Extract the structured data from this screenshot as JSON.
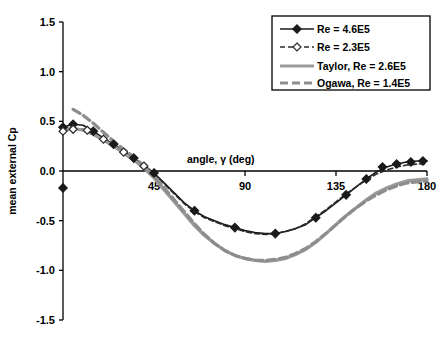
{
  "chart_data": {
    "type": "line",
    "title": "",
    "xlabel": "angle, γ (deg)",
    "ylabel": "mean external Cp",
    "xlim": [
      0,
      180
    ],
    "ylim": [
      -1.5,
      1.5
    ],
    "xticks": [
      0,
      45,
      90,
      135,
      180
    ],
    "xtick_labels": [
      "0",
      "45",
      "90",
      "135",
      "180"
    ],
    "yticks": [
      -1.5,
      -1.0,
      -0.5,
      0.0,
      0.5,
      1.0,
      1.5
    ],
    "ytick_labels": [
      "-1.5",
      "-1.0",
      "-0.5",
      "0.0",
      "0.5",
      "1.0",
      "1.5"
    ],
    "grid": false,
    "legend_position": "top-right",
    "series": [
      {
        "name": "Re = 4.6E5",
        "color": "#1a1a1a",
        "style": "solid",
        "marker": "filled-diamond",
        "x": [
          0,
          5,
          10,
          15,
          20,
          25,
          30,
          35,
          40,
          45,
          50,
          55,
          60,
          65,
          70,
          75,
          80,
          85,
          90,
          95,
          100,
          105,
          110,
          115,
          120,
          125,
          130,
          135,
          140,
          145,
          150,
          155,
          160,
          165,
          170,
          175,
          180
        ],
        "y": [
          0.44,
          0.47,
          0.46,
          0.4,
          0.33,
          0.27,
          0.2,
          0.13,
          0.06,
          -0.02,
          -0.12,
          -0.22,
          -0.32,
          -0.4,
          -0.46,
          -0.5,
          -0.54,
          -0.57,
          -0.6,
          -0.62,
          -0.63,
          -0.63,
          -0.61,
          -0.58,
          -0.54,
          -0.47,
          -0.4,
          -0.32,
          -0.24,
          -0.16,
          -0.08,
          -0.01,
          0.04,
          0.07,
          0.09,
          0.1,
          0.1
        ],
        "marker_x": [
          0,
          5,
          15,
          25,
          35,
          45,
          65,
          85,
          105,
          125,
          140,
          150,
          158,
          165,
          172,
          178
        ],
        "marker_y": [
          0.44,
          0.47,
          0.4,
          0.27,
          0.13,
          -0.02,
          -0.4,
          -0.57,
          -0.63,
          -0.47,
          -0.24,
          -0.08,
          0.04,
          0.07,
          0.09,
          0.1
        ]
      },
      {
        "name": "Re = 2.3E5",
        "color": "#2b2b2b",
        "style": "dashed",
        "marker": "open-diamond",
        "x": [
          0,
          5,
          10,
          15,
          20,
          25,
          30,
          35,
          40,
          45,
          50,
          55,
          60,
          65,
          70,
          75,
          80,
          85,
          90,
          95,
          100,
          105,
          110,
          115,
          120,
          125,
          130,
          135,
          140,
          145,
          150,
          155,
          160,
          165,
          170,
          175,
          180
        ],
        "y": [
          0.4,
          0.42,
          0.42,
          0.38,
          0.32,
          0.26,
          0.19,
          0.12,
          0.05,
          -0.03,
          -0.13,
          -0.23,
          -0.33,
          -0.41,
          -0.47,
          -0.51,
          -0.55,
          -0.58,
          -0.61,
          -0.63,
          -0.64,
          -0.63,
          -0.61,
          -0.58,
          -0.53,
          -0.46,
          -0.39,
          -0.31,
          -0.23,
          -0.16,
          -0.09,
          -0.03,
          0.01,
          0.04,
          0.06,
          0.07,
          0.07
        ],
        "marker_x": [
          0,
          5,
          12,
          20,
          30,
          40
        ],
        "marker_y": [
          0.4,
          0.42,
          0.41,
          0.32,
          0.19,
          0.05
        ]
      },
      {
        "name": "Taylor, Re = 2.6E5",
        "color": "#9a9a9a",
        "style": "solid",
        "marker": "none",
        "x": [
          0,
          5,
          10,
          15,
          20,
          25,
          30,
          35,
          40,
          45,
          50,
          55,
          60,
          65,
          70,
          75,
          80,
          85,
          90,
          95,
          100,
          105,
          110,
          115,
          120,
          125,
          130,
          135,
          140,
          145,
          150,
          155,
          160,
          165,
          170,
          175,
          180
        ],
        "y": [
          0.42,
          0.43,
          0.41,
          0.37,
          0.31,
          0.25,
          0.18,
          0.11,
          0.03,
          -0.07,
          -0.19,
          -0.31,
          -0.43,
          -0.55,
          -0.65,
          -0.73,
          -0.8,
          -0.85,
          -0.88,
          -0.9,
          -0.91,
          -0.9,
          -0.88,
          -0.84,
          -0.79,
          -0.72,
          -0.63,
          -0.54,
          -0.45,
          -0.37,
          -0.29,
          -0.22,
          -0.17,
          -0.13,
          -0.1,
          -0.09,
          -0.08
        ]
      },
      {
        "name": "Ogawa, Re = 1.4E5",
        "color": "#8d8d8d",
        "style": "dashed",
        "marker": "none",
        "x": [
          5,
          10,
          15,
          20,
          25,
          30,
          35,
          40,
          45,
          50,
          55,
          60,
          65,
          70,
          75,
          80,
          85,
          90,
          95,
          100,
          105,
          110,
          115,
          120,
          125,
          130,
          135,
          140,
          145,
          150,
          155,
          160,
          165,
          170,
          175,
          180
        ],
        "y": [
          0.62,
          0.56,
          0.48,
          0.39,
          0.3,
          0.22,
          0.14,
          0.05,
          -0.05,
          -0.17,
          -0.29,
          -0.41,
          -0.53,
          -0.64,
          -0.73,
          -0.8,
          -0.85,
          -0.88,
          -0.9,
          -0.9,
          -0.89,
          -0.87,
          -0.83,
          -0.78,
          -0.71,
          -0.63,
          -0.54,
          -0.45,
          -0.37,
          -0.3,
          -0.24,
          -0.19,
          -0.15,
          -0.12,
          -0.11,
          -0.1
        ]
      }
    ],
    "extra_points": [
      {
        "x": 0,
        "y": -0.17,
        "marker": "filled-diamond",
        "color": "#1a1a1a"
      }
    ]
  },
  "legend": {
    "entries": [
      {
        "label": "Re = 4.6E5"
      },
      {
        "label": "Re = 2.3E5"
      },
      {
        "label": "Taylor, Re = 2.6E5"
      },
      {
        "label": "Ogawa, Re = 1.4E5"
      }
    ]
  }
}
